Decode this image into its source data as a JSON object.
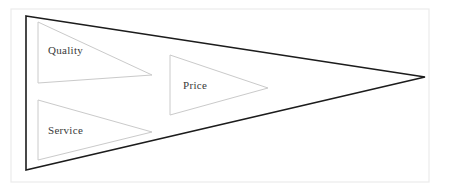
{
  "diagram": {
    "type": "funnel-triangle",
    "title": "",
    "background_color": "#ffffff",
    "frame": {
      "name": "outer-frame",
      "x": 11,
      "y": 9,
      "width": 418,
      "height": 173,
      "stroke_color": "#ebebeb",
      "stroke_width": 1.2
    },
    "main_triangle": {
      "name": "main-funnel-triangle",
      "points": "26,16 425,77 26,170",
      "stroke_color": "#1c1c1c",
      "stroke_width": 1.6,
      "fill": "none"
    },
    "inner_triangles": [
      {
        "id": "quality",
        "label": "Quality",
        "points": "38,22 152,75 38,83",
        "stroke_color": "#cacaca",
        "stroke_width": 1,
        "fill": "none",
        "label_x": 48,
        "label_y": 51
      },
      {
        "id": "price",
        "label": "Price",
        "points": "170,55 268,88 170,115",
        "stroke_color": "#cacaca",
        "stroke_width": 1,
        "fill": "none",
        "label_x": 183,
        "label_y": 86
      },
      {
        "id": "service",
        "label": "Service",
        "points": "38,100 152,132 38,160",
        "stroke_color": "#cacaca",
        "stroke_width": 1,
        "fill": "none",
        "label_x": 48,
        "label_y": 131
      }
    ]
  }
}
